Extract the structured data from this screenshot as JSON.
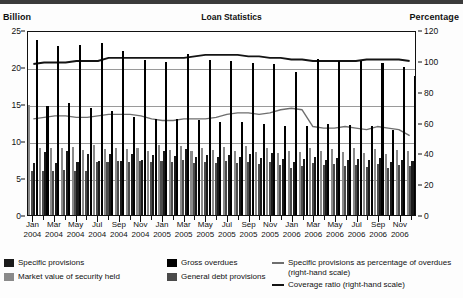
{
  "header": {
    "title": "Loan Statistics",
    "left_axis_caption": "Billion",
    "right_axis_caption": "Percentage"
  },
  "legend": {
    "items": [
      {
        "key": "specific_provisions",
        "label": "Specific provisions",
        "type": "swatch",
        "color": "#1a1a1a"
      },
      {
        "key": "market_value",
        "label": "Market value of security held",
        "type": "swatch",
        "color": "#8a8a8a"
      },
      {
        "key": "gross_overdues",
        "label": "Gross overdues",
        "type": "swatch",
        "color": "#000000"
      },
      {
        "key": "general_debt_provisions",
        "label": "General debt provisions",
        "type": "swatch",
        "color": "#4a4a4a"
      },
      {
        "key": "spec_pct_overdues",
        "label": "Specific provisions as percentage of overdues (right-hand scale)",
        "type": "line",
        "color": "#6e6e6e"
      },
      {
        "key": "coverage_ratio",
        "label": "Coverage ratio (right-hand scale)",
        "type": "line",
        "color": "#141414"
      }
    ]
  },
  "chart_data": {
    "type": "bar",
    "title": "Loan Statistics",
    "xlabel": "",
    "ylabel": "Billion",
    "y2label": "Percentage",
    "ylim": [
      0,
      25
    ],
    "y2lim": [
      0,
      120
    ],
    "yticks": [
      0,
      5,
      10,
      15,
      20,
      25
    ],
    "y2ticks": [
      0,
      20,
      40,
      60,
      80,
      100,
      120
    ],
    "grid": true,
    "legend_position": "bottom",
    "x": [
      "Jan 2004",
      "Feb 2004",
      "Mar 2004",
      "Apr 2004",
      "May 2004",
      "Jun 2004",
      "Jul 2004",
      "Aug 2004",
      "Sep 2004",
      "Oct 2004",
      "Nov 2004",
      "Dec 2004",
      "Jan 2005",
      "Feb 2005",
      "Mar 2005",
      "Apr 2005",
      "May 2005",
      "Jun 2005",
      "Jul 2005",
      "Aug 2005",
      "Sep 2005",
      "Oct 2005",
      "Nov 2005",
      "Dec 2005",
      "Jan 2006",
      "Feb 2006",
      "Mar 2006",
      "Apr 2006",
      "May 2006",
      "Jun 2006",
      "Jul 2006",
      "Aug 2006",
      "Sep 2006",
      "Oct 2006",
      "Nov 2006",
      "Dec 2006"
    ],
    "tick_labels": [
      {
        "index": 0,
        "month": "Jan",
        "year": "2004"
      },
      {
        "index": 2,
        "month": "Mar",
        "year": "2004"
      },
      {
        "index": 4,
        "month": "May",
        "year": "2004"
      },
      {
        "index": 6,
        "month": "Jul",
        "year": "2004"
      },
      {
        "index": 8,
        "month": "Sep",
        "year": "2004"
      },
      {
        "index": 10,
        "month": "Nov",
        "year": "2004"
      },
      {
        "index": 12,
        "month": "Jan",
        "year": "2005"
      },
      {
        "index": 14,
        "month": "Mar",
        "year": "2005"
      },
      {
        "index": 16,
        "month": "May",
        "year": "2005"
      },
      {
        "index": 18,
        "month": "Jul",
        "year": "2005"
      },
      {
        "index": 20,
        "month": "Sep",
        "year": "2005"
      },
      {
        "index": 22,
        "month": "Nov",
        "year": "2005"
      },
      {
        "index": 24,
        "month": "Jan",
        "year": "2006"
      },
      {
        "index": 26,
        "month": "Mar",
        "year": "2006"
      },
      {
        "index": 28,
        "month": "May",
        "year": "2006"
      },
      {
        "index": 30,
        "month": "Jul",
        "year": "2006"
      },
      {
        "index": 32,
        "month": "Sep",
        "year": "2006"
      },
      {
        "index": 34,
        "month": "Nov",
        "year": "2006"
      }
    ],
    "series": [
      {
        "name": "Gross overdues",
        "key": "gross_overdues",
        "type": "bar",
        "axis": "left",
        "color": "#000000",
        "values": [
          23.7,
          14.7,
          22.9,
          15.2,
          23.0,
          14.4,
          23.2,
          14.0,
          22.2,
          13.3,
          21.0,
          13.0,
          20.7,
          13.0,
          21.7,
          12.8,
          20.9,
          12.6,
          20.8,
          12.6,
          20.6,
          12.3,
          20.4,
          12.0,
          19.3,
          12.0,
          21.1,
          12.3,
          20.8,
          12.2,
          20.8,
          12.0,
          20.6,
          11.5,
          20.0,
          18.8
        ]
      },
      {
        "name": "Market value of security held",
        "key": "market_value",
        "type": "bar",
        "axis": "left",
        "color": "#8a8a8a",
        "values": [
          14.9,
          9.0,
          9.1,
          9.0,
          9.2,
          8.8,
          9.4,
          8.9,
          9.1,
          8.9,
          9.0,
          8.6,
          9.4,
          8.8,
          9.3,
          8.7,
          9.1,
          8.8,
          9.2,
          8.7,
          9.3,
          8.5,
          9.0,
          8.4,
          8.7,
          8.5,
          9.1,
          8.6,
          8.9,
          8.5,
          9.0,
          8.4,
          8.9,
          8.2,
          8.8,
          8.6
        ]
      },
      {
        "name": "Specific provisions",
        "key": "specific_provisions",
        "type": "bar",
        "axis": "left",
        "color": "#1a1a1a",
        "values": [
          7.0,
          8.5,
          7.0,
          8.6,
          7.1,
          8.3,
          7.3,
          8.2,
          7.3,
          8.2,
          7.5,
          8.1,
          8.7,
          8.0,
          8.9,
          7.9,
          8.1,
          7.8,
          8.1,
          7.9,
          8.3,
          7.7,
          8.4,
          7.6,
          7.2,
          7.6,
          7.8,
          7.5,
          7.7,
          7.5,
          7.6,
          7.4,
          7.7,
          7.2,
          7.5,
          7.3
        ]
      },
      {
        "name": "General debt provisions",
        "key": "general_debt_provisions",
        "type": "bar",
        "axis": "left",
        "color": "#4a4a4a",
        "values": [
          6.0,
          6.0,
          6.0,
          6.1,
          6.0,
          5.9,
          7.2,
          7.2,
          7.3,
          7.2,
          7.3,
          7.1,
          7.3,
          7.1,
          7.4,
          7.0,
          7.2,
          7.0,
          7.3,
          7.0,
          7.2,
          6.9,
          7.1,
          6.8,
          6.4,
          6.6,
          7.0,
          6.7,
          6.9,
          6.6,
          6.8,
          6.5,
          6.9,
          6.4,
          6.7,
          6.6
        ]
      },
      {
        "name": "Specific provisions as percentage of overdues (right-hand scale)",
        "key": "spec_pct_overdues",
        "type": "line",
        "axis": "right",
        "color": "#6e6e6e",
        "values": [
          63,
          64,
          65,
          65,
          64,
          64,
          65,
          66,
          66,
          66,
          65,
          63,
          62,
          62,
          63,
          63,
          63,
          64,
          66,
          67,
          67,
          66,
          67,
          69,
          70,
          69,
          58,
          57,
          57,
          58,
          57,
          56,
          58,
          57,
          56,
          52
        ]
      },
      {
        "name": "Coverage ratio (right-hand scale)",
        "key": "coverage_ratio",
        "type": "line",
        "axis": "right",
        "color": "#141414",
        "values": [
          99,
          100,
          100,
          100,
          101,
          101,
          101,
          103,
          103,
          103,
          103,
          103,
          103,
          103,
          103,
          104,
          105,
          105,
          105,
          105,
          104,
          104,
          103,
          103,
          102,
          102,
          101,
          101,
          101,
          101,
          101,
          102,
          102,
          102,
          102,
          101
        ]
      }
    ]
  }
}
